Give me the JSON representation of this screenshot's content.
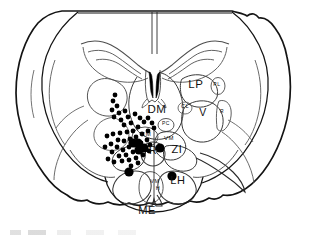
{
  "figure": {
    "kind": "brain-atlas-coronal-section",
    "title": "",
    "caption_partial": ""
  },
  "labels": [
    {
      "id": "DM",
      "text": "DM",
      "x": 157,
      "y": 113,
      "size": 11.5,
      "weight": "normal"
    },
    {
      "id": "LP",
      "text": "LP",
      "x": 196,
      "y": 88,
      "size": 11.5,
      "weight": "normal"
    },
    {
      "id": "PL",
      "text": "PL",
      "x": 217,
      "y": 86,
      "size": 5.0,
      "weight": "normal"
    },
    {
      "id": "CL",
      "text": "CL",
      "x": 185,
      "y": 108,
      "size": 5.5,
      "weight": "normal"
    },
    {
      "id": "V",
      "text": "V",
      "x": 203,
      "y": 116,
      "size": 10.5,
      "weight": "normal"
    },
    {
      "id": "R2",
      "text": "R",
      "x": 222,
      "y": 113,
      "size": 5.0,
      "weight": "normal"
    },
    {
      "id": "PC",
      "text": "PC",
      "x": 166,
      "y": 125,
      "size": 5.0,
      "weight": "normal"
    },
    {
      "id": "VM",
      "text": "VM",
      "x": 169,
      "y": 140,
      "size": 6.0,
      "weight": "normal"
    },
    {
      "id": "CM",
      "text": "CM",
      "x": 146,
      "y": 136,
      "size": 6.0,
      "weight": "normal"
    },
    {
      "id": "R",
      "text": "R",
      "x": 153,
      "y": 154,
      "size": 10.5,
      "weight": "normal"
    },
    {
      "id": "ZI",
      "text": "ZI",
      "x": 177,
      "y": 153,
      "size": 11.0,
      "weight": "normal"
    },
    {
      "id": "LH",
      "text": "LH",
      "x": 178,
      "y": 184,
      "size": 11.0,
      "weight": "normal"
    },
    {
      "id": "VMH1",
      "text": "VM",
      "x": 155,
      "y": 183,
      "size": 5.5,
      "weight": "normal"
    },
    {
      "id": "VMH2",
      "text": "H",
      "x": 158,
      "y": 190,
      "size": 5.5,
      "weight": "normal"
    },
    {
      "id": "ME",
      "text": "ME",
      "x": 147,
      "y": 214,
      "size": 11.0,
      "weight": "normal"
    }
  ],
  "markers": {
    "small_label": "injection-site-small",
    "large_label": "injection-site-large",
    "small_r": 2.4,
    "large_r": 4.6,
    "color": "#000000",
    "small": [
      [
        115,
        95
      ],
      [
        113,
        101
      ],
      [
        117,
        106
      ],
      [
        112,
        110
      ],
      [
        119,
        113
      ],
      [
        114,
        117
      ],
      [
        121,
        120
      ],
      [
        125,
        111
      ],
      [
        128,
        117
      ],
      [
        131,
        123
      ],
      [
        124,
        125
      ],
      [
        135,
        114
      ],
      [
        140,
        118
      ],
      [
        144,
        122
      ],
      [
        148,
        118
      ],
      [
        152,
        123
      ],
      [
        138,
        127
      ],
      [
        133,
        131
      ],
      [
        127,
        132
      ],
      [
        120,
        133
      ],
      [
        113,
        134
      ],
      [
        107,
        136
      ],
      [
        118,
        140
      ],
      [
        124,
        141
      ],
      [
        130,
        139
      ],
      [
        136,
        137
      ],
      [
        142,
        134
      ],
      [
        148,
        131
      ],
      [
        154,
        128
      ],
      [
        111,
        144
      ],
      [
        117,
        147
      ],
      [
        123,
        150
      ],
      [
        129,
        147
      ],
      [
        135,
        145
      ],
      [
        141,
        143
      ],
      [
        147,
        140
      ],
      [
        105,
        147
      ],
      [
        112,
        152
      ],
      [
        119,
        156
      ],
      [
        126,
        155
      ],
      [
        133,
        152
      ],
      [
        140,
        150
      ],
      [
        144,
        147
      ],
      [
        150,
        145
      ],
      [
        122,
        161
      ],
      [
        129,
        160
      ],
      [
        136,
        158
      ],
      [
        131,
        166
      ],
      [
        138,
        163
      ],
      [
        108,
        159
      ],
      [
        114,
        162
      ],
      [
        143,
        155
      ],
      [
        149,
        151
      ]
    ],
    "large": [
      [
        138,
        143
      ],
      [
        144,
        148
      ],
      [
        133,
        143
      ],
      [
        139,
        150
      ],
      [
        129,
        172
      ],
      [
        172,
        176
      ],
      [
        160,
        148
      ]
    ]
  },
  "colors": {
    "outline": "#1a1a1a",
    "inner_outline": "#555555",
    "fill": "#ffffff",
    "marker": "#000000"
  }
}
